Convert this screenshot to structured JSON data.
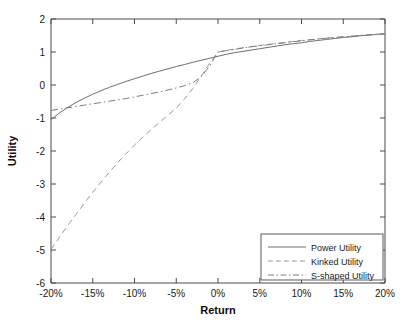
{
  "chart_data": {
    "type": "line",
    "title": "",
    "xlabel": "Return",
    "ylabel": "Utility",
    "xlim": [
      -20,
      20
    ],
    "ylim": [
      -6,
      2
    ],
    "grid": false,
    "legend_position": "bottom-right",
    "x_tick_labels": [
      "-20%",
      "-15%",
      "-10%",
      "-5%",
      "0%",
      "5%",
      "10%",
      "15%",
      "20%"
    ],
    "x_tick_values": [
      -20,
      -15,
      -10,
      -5,
      0,
      5,
      10,
      15,
      20
    ],
    "y_tick_labels": [
      "2",
      "1",
      "0",
      "-1",
      "-2",
      "-3",
      "-4",
      "-5",
      "-6"
    ],
    "y_tick_values": [
      2,
      1,
      0,
      -1,
      -2,
      -3,
      -4,
      -5,
      -6
    ],
    "x": [
      -20,
      -19,
      -18,
      -17,
      -16,
      -15,
      -14,
      -13,
      -12,
      -11,
      -10,
      -9,
      -8,
      -7,
      -6,
      -5,
      -4,
      -3,
      -2,
      -1,
      0,
      1,
      2,
      3,
      4,
      5,
      6,
      7,
      8,
      9,
      10,
      11,
      12,
      13,
      14,
      15,
      16,
      17,
      18,
      19,
      20
    ],
    "series": [
      {
        "name": "Power Utility",
        "style": "solid",
        "color": "#6e6e6e",
        "values": [
          -1.05,
          -0.85,
          -0.68,
          -0.53,
          -0.4,
          -0.28,
          -0.17,
          -0.07,
          0.02,
          0.11,
          0.19,
          0.27,
          0.35,
          0.42,
          0.49,
          0.56,
          0.62,
          0.69,
          0.75,
          0.81,
          0.87,
          0.93,
          0.98,
          1.02,
          1.06,
          1.1,
          1.14,
          1.18,
          1.22,
          1.25,
          1.28,
          1.32,
          1.35,
          1.38,
          1.41,
          1.44,
          1.46,
          1.49,
          1.51,
          1.53,
          1.55
        ]
      },
      {
        "name": "Kinked Utility",
        "style": "dashed",
        "color": "#9a9a9a",
        "values": [
          -4.98,
          -4.62,
          -4.26,
          -3.92,
          -3.58,
          -3.25,
          -2.94,
          -2.64,
          -2.35,
          -2.08,
          -1.82,
          -1.58,
          -1.35,
          -1.13,
          -0.92,
          -0.7,
          -0.42,
          -0.1,
          0.28,
          0.66,
          1.0,
          1.05,
          1.09,
          1.13,
          1.16,
          1.2,
          1.23,
          1.26,
          1.29,
          1.32,
          1.35,
          1.37,
          1.4,
          1.42,
          1.44,
          1.46,
          1.48,
          1.5,
          1.52,
          1.54,
          1.55
        ]
      },
      {
        "name": "S-shaped Utility",
        "style": "dash-dot",
        "color": "#7d7d7d",
        "values": [
          -0.77,
          -0.73,
          -0.69,
          -0.65,
          -0.61,
          -0.57,
          -0.53,
          -0.49,
          -0.45,
          -0.41,
          -0.36,
          -0.31,
          -0.26,
          -0.21,
          -0.15,
          -0.09,
          -0.02,
          0.07,
          0.25,
          0.58,
          1.0,
          1.04,
          1.08,
          1.12,
          1.16,
          1.19,
          1.22,
          1.25,
          1.28,
          1.31,
          1.34,
          1.37,
          1.39,
          1.42,
          1.44,
          1.46,
          1.48,
          1.5,
          1.52,
          1.54,
          1.55
        ]
      }
    ],
    "legend_entries": [
      "Power Utility",
      "Kinked Utility",
      "S-shaped Utility"
    ]
  }
}
